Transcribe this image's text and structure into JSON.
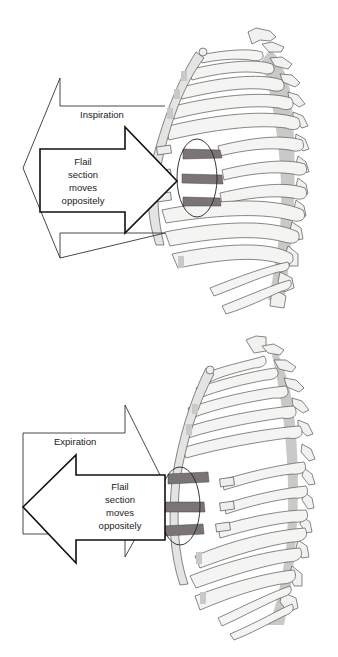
{
  "figure": {
    "panels": [
      {
        "id": "inspiration",
        "phase_label": "Inspiration",
        "phase_arrow_direction": "left",
        "flail_label": [
          "Flail",
          "section",
          "moves",
          "oppositely"
        ],
        "flail_arrow_direction": "right"
      },
      {
        "id": "expiration",
        "phase_label": "Expiration",
        "phase_arrow_direction": "right",
        "flail_label": [
          "Flail",
          "section",
          "moves",
          "oppositely"
        ],
        "flail_arrow_direction": "left"
      }
    ],
    "colors": {
      "background": "#ffffff",
      "outline": "#333333",
      "rib_fill": "#f4f4f2",
      "cartilage": "#c9c9c7",
      "flail_segment": "#7a7474",
      "spine_shadow": "#bdbdbb"
    }
  }
}
